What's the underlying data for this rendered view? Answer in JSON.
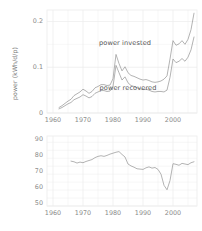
{
  "chart_data": [
    {
      "id": "power",
      "type": "line",
      "title": "",
      "xlabel": "",
      "ylabel": "power (kWh/d/p)",
      "xlim": [
        1958,
        2008
      ],
      "ylim": [
        0,
        0.225
      ],
      "xticks": [
        1960,
        1970,
        1980,
        1990,
        2000
      ],
      "xticklabels": [
        "1960",
        "1970",
        "1980",
        "1990",
        "2000"
      ],
      "yticks": [
        0,
        0.1,
        0.2
      ],
      "yticklabels": [
        "0",
        "0.1",
        "0.2"
      ],
      "grid": true,
      "legend": "annotations",
      "annotations": [
        {
          "text": "power invested",
          "x": 1984,
          "y": 0.152
        },
        {
          "text": "power recovered",
          "x": 1985,
          "y": 0.055
        }
      ],
      "series": [
        {
          "name": "power invested",
          "x": [
            1962,
            1963,
            1964,
            1965,
            1966,
            1967,
            1968,
            1969,
            1970,
            1971,
            1972,
            1973,
            1974,
            1975,
            1976,
            1977,
            1978,
            1979,
            1980,
            1981,
            1982,
            1983,
            1984,
            1985,
            1986,
            1987,
            1988,
            1989,
            1990,
            1991,
            1992,
            1993,
            1994,
            1995,
            1996,
            1997,
            1998,
            1999,
            2000,
            2001,
            2002,
            2003,
            2004,
            2005,
            2006,
            2007
          ],
          "values": [
            0.012,
            0.016,
            0.021,
            0.026,
            0.03,
            0.038,
            0.042,
            0.046,
            0.052,
            0.048,
            0.043,
            0.047,
            0.055,
            0.058,
            0.062,
            0.062,
            0.06,
            0.061,
            0.075,
            0.128,
            0.108,
            0.092,
            0.101,
            0.088,
            0.082,
            0.08,
            0.077,
            0.074,
            0.072,
            0.073,
            0.071,
            0.068,
            0.067,
            0.068,
            0.07,
            0.074,
            0.081,
            0.118,
            0.158,
            0.148,
            0.151,
            0.158,
            0.15,
            0.161,
            0.182,
            0.218
          ]
        },
        {
          "name": "power recovered",
          "x": [
            1962,
            1963,
            1964,
            1965,
            1966,
            1967,
            1968,
            1969,
            1970,
            1971,
            1972,
            1973,
            1974,
            1975,
            1976,
            1977,
            1978,
            1979,
            1980,
            1981,
            1982,
            1983,
            1984,
            1985,
            1986,
            1987,
            1988,
            1989,
            1990,
            1991,
            1992,
            1993,
            1994,
            1995,
            1996,
            1997,
            1998,
            1999,
            2000,
            2001,
            2002,
            2003,
            2004,
            2005,
            2006,
            2007
          ],
          "values": [
            0.009,
            0.012,
            0.016,
            0.02,
            0.023,
            0.029,
            0.032,
            0.035,
            0.04,
            0.037,
            0.033,
            0.036,
            0.043,
            0.046,
            0.049,
            0.049,
            0.047,
            0.048,
            0.058,
            0.104,
            0.088,
            0.072,
            0.079,
            0.066,
            0.06,
            0.058,
            0.055,
            0.053,
            0.051,
            0.052,
            0.05,
            0.047,
            0.046,
            0.047,
            0.047,
            0.046,
            0.05,
            0.078,
            0.118,
            0.11,
            0.113,
            0.119,
            0.113,
            0.122,
            0.138,
            0.166
          ]
        }
      ]
    },
    {
      "id": "efficiency",
      "type": "line",
      "title": "",
      "xlabel": "",
      "ylabel": "efficiency (%)",
      "xlim": [
        1958,
        2008
      ],
      "ylim": [
        48,
        92
      ],
      "xticks": [
        1960,
        1970,
        1980,
        1990,
        2000
      ],
      "xticklabels": [
        "1960",
        "1970",
        "1980",
        "1990",
        "2000"
      ],
      "yticks": [
        50,
        60,
        70,
        80,
        90
      ],
      "yticklabels": [
        "50",
        "60",
        "70",
        "80",
        "90"
      ],
      "grid": true,
      "series": [
        {
          "name": "efficiency",
          "x": [
            1966,
            1967,
            1968,
            1969,
            1970,
            1971,
            1972,
            1973,
            1974,
            1975,
            1976,
            1977,
            1978,
            1979,
            1980,
            1981,
            1982,
            1983,
            1984,
            1985,
            1986,
            1987,
            1988,
            1989,
            1990,
            1991,
            1992,
            1993,
            1994,
            1995,
            1996,
            1997,
            1998,
            1999,
            2000,
            2001,
            2002,
            2003,
            2004,
            2005,
            2006,
            2007
          ],
          "values": [
            76.2,
            75.8,
            75.0,
            75.6,
            75.2,
            76.0,
            76.6,
            77.2,
            78.4,
            79.2,
            79.6,
            79.2,
            79.8,
            80.6,
            81.2,
            81.8,
            82.2,
            80.4,
            78.8,
            74.4,
            73.2,
            72.4,
            71.4,
            71.2,
            71.0,
            72.0,
            72.6,
            71.8,
            72.2,
            71.0,
            68.0,
            61.0,
            58.2,
            64.0,
            74.6,
            74.2,
            73.6,
            74.8,
            74.4,
            74.0,
            75.2,
            75.8
          ]
        }
      ]
    }
  ],
  "labels": {
    "power_ylabel": "power (kWh/d/p)",
    "efficiency_ylabel": "efficiency (%)",
    "annotation_invested": "power invested",
    "annotation_recovered": "power recovered",
    "power_ytick_0": "0",
    "power_ytick_1": "0.1",
    "power_ytick_2": "0.2",
    "eff_ytick_50": "50",
    "eff_ytick_60": "60",
    "eff_ytick_70": "70",
    "eff_ytick_80": "80",
    "eff_ytick_90": "90",
    "xtick_1960": "1960",
    "xtick_1970": "1970",
    "xtick_1980": "1980",
    "xtick_1990": "1990",
    "xtick_2000": "2000"
  },
  "style": {
    "line_color": "#9a9a9a",
    "grid_color": "#ececec",
    "text_color": "#7a7a7a",
    "background": "#ffffff"
  }
}
